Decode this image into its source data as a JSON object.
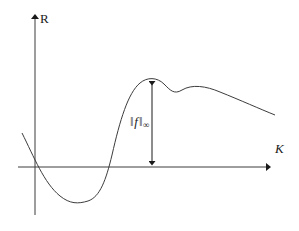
{
  "figure": {
    "kind": "mathematical-plot",
    "background_color": "#ffffff",
    "stroke_color": "#1a1a1a",
    "axes": {
      "vertical": {
        "label": "R",
        "label_style": "upright",
        "x": 35,
        "top_y": 13,
        "bottom_y": 215,
        "arrow": "up"
      },
      "horizontal": {
        "label": "K",
        "label_style": "italic",
        "y": 167,
        "left_x": 18,
        "right_x": 272,
        "arrow": "right"
      }
    },
    "annotation": {
      "text_parts": {
        "left_bars": "‖",
        "function": "f",
        "right_bars": "‖",
        "subscript": "∞"
      },
      "plain_text": "‖f‖∞",
      "meaning": "supremum-norm",
      "measure_line": {
        "x": 152,
        "top_y": 79,
        "bottom_y": 167,
        "arrowheads": "both"
      }
    },
    "curve": {
      "description": "smooth oscillating function: descends from upper-left, dips below axis to a minimum, rises steeply to a global maximum, then decays with a small plateau bump",
      "path": "M 22 133 C 34 157, 44 183, 60 196 C 70 204, 78 204, 88 201 C 100 197, 106 180, 112 155 C 120 120, 128 93, 140 83 C 147 77, 157 77, 164 84 C 170 90, 174 95, 182 90 C 192 84, 206 86, 220 92 C 240 100, 260 109, 275 115",
      "key_points": {
        "start": [
          22,
          133
        ],
        "first_zero_crossing": [
          42,
          167
        ],
        "minimum": [
          82,
          202
        ],
        "second_zero_crossing": [
          115,
          167
        ],
        "maximum": [
          152,
          79
        ],
        "local_dip": [
          176,
          91
        ],
        "plateau_bump": [
          192,
          87
        ],
        "end": [
          275,
          115
        ]
      }
    }
  }
}
